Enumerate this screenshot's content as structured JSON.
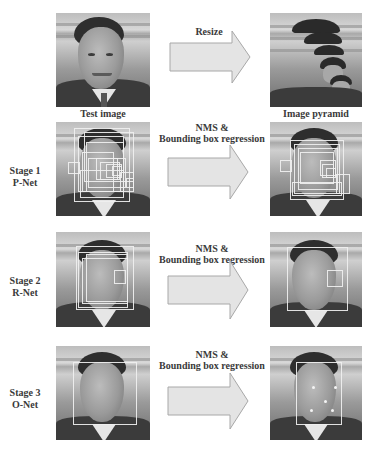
{
  "figure": {
    "top_row": {
      "left_caption": "Test image",
      "arrow_label": "Resize",
      "right_caption": "Image pyramid"
    },
    "stages": [
      {
        "label_line1": "Stage 1",
        "label_line2": "P-Net",
        "arrow_line1": "NMS &",
        "arrow_line2": "Bounding box regression",
        "input_boxes": 14,
        "output_boxes": 10
      },
      {
        "label_line1": "Stage 2",
        "label_line2": "R-Net",
        "arrow_line1": "NMS &",
        "arrow_line2": "Bounding box regression",
        "input_boxes": 5,
        "output_boxes": 2
      },
      {
        "label_line1": "Stage 3",
        "label_line2": "O-Net",
        "arrow_line1": "NMS &",
        "arrow_line2": "Bounding box regression",
        "input_boxes": 1,
        "output_boxes": 1,
        "output_landmarks": 5
      }
    ],
    "colors": {
      "background": "#ffffff",
      "text": "#3a3a3a",
      "arrow_fill": "#e4e4e4",
      "arrow_stroke": "#a8a8a8",
      "box_stroke": "#f0f0f0"
    }
  }
}
